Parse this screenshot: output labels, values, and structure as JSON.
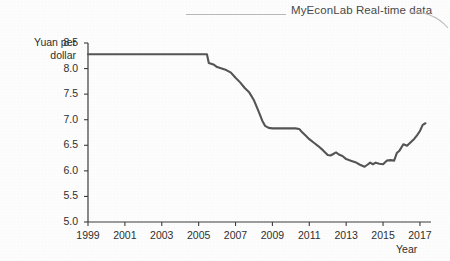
{
  "header": {
    "brand": "MyEconLab",
    "subtitle": "Real-time data",
    "full_title": "MyEconLab Real-time data",
    "rule_icon": "horizontal-rule",
    "curve_icon": "banner-curve"
  },
  "colors": {
    "line": "#555555",
    "axis": "#3d3d3d",
    "text": "#2f2f2f",
    "header_text": "#4a4a4a",
    "rule": "#b9b9b9",
    "background": "#fdfdfd"
  },
  "chart_data": {
    "type": "line",
    "title": "",
    "subtitle": "",
    "xlabel": "Year",
    "ylabel": "Yuan per dollar",
    "ylabel_lines": [
      "Yuan per",
      "dollar"
    ],
    "xlim": [
      1999,
      2017.6
    ],
    "ylim": [
      5.0,
      8.5
    ],
    "grid": false,
    "legend": null,
    "yticks": [
      "8.5",
      "8.0",
      "7.5",
      "7.0",
      "6.5",
      "6.0",
      "5.5",
      "5.0"
    ],
    "ytick_values": [
      8.5,
      8.0,
      7.5,
      7.0,
      6.5,
      6.0,
      5.5,
      5.0
    ],
    "xticks": [
      "1999",
      "2001",
      "2003",
      "2005",
      "2007",
      "2009",
      "2011",
      "2013",
      "2015",
      "2017"
    ],
    "xtick_values": [
      1999,
      2001,
      2003,
      2005,
      2007,
      2009,
      2011,
      2013,
      2015,
      2017
    ],
    "series": [
      {
        "name": "Yuan per dollar exchange rate",
        "x": [
          1999.0,
          1999.5,
          2000.0,
          2000.5,
          2001.0,
          2001.5,
          2002.0,
          2002.5,
          2003.0,
          2003.5,
          2004.0,
          2004.5,
          2005.0,
          2005.45,
          2005.55,
          2005.8,
          2006.0,
          2006.25,
          2006.5,
          2006.75,
          2007.0,
          2007.25,
          2007.5,
          2007.75,
          2008.0,
          2008.15,
          2008.3,
          2008.45,
          2008.6,
          2008.8,
          2009.0,
          2009.25,
          2009.5,
          2009.75,
          2010.0,
          2010.25,
          2010.45,
          2010.6,
          2010.8,
          2011.0,
          2011.25,
          2011.5,
          2011.75,
          2012.0,
          2012.15,
          2012.3,
          2012.45,
          2012.6,
          2012.8,
          2013.0,
          2013.25,
          2013.5,
          2013.75,
          2014.0,
          2014.15,
          2014.3,
          2014.45,
          2014.6,
          2014.8,
          2015.0,
          2015.2,
          2015.4,
          2015.6,
          2015.75,
          2015.9,
          2016.1,
          2016.3,
          2016.5,
          2016.7,
          2016.85,
          2017.0,
          2017.15,
          2017.3
        ],
        "y": [
          8.28,
          8.28,
          8.28,
          8.28,
          8.28,
          8.28,
          8.28,
          8.28,
          8.28,
          8.28,
          8.28,
          8.28,
          8.28,
          8.28,
          8.11,
          8.08,
          8.03,
          8.0,
          7.97,
          7.92,
          7.82,
          7.73,
          7.62,
          7.53,
          7.38,
          7.25,
          7.12,
          6.98,
          6.88,
          6.84,
          6.83,
          6.83,
          6.83,
          6.83,
          6.83,
          6.83,
          6.82,
          6.76,
          6.69,
          6.62,
          6.55,
          6.48,
          6.4,
          6.31,
          6.3,
          6.33,
          6.36,
          6.32,
          6.29,
          6.23,
          6.2,
          6.17,
          6.12,
          6.08,
          6.12,
          6.16,
          6.13,
          6.16,
          6.14,
          6.13,
          6.2,
          6.21,
          6.2,
          6.35,
          6.4,
          6.52,
          6.49,
          6.56,
          6.63,
          6.7,
          6.78,
          6.9,
          6.93
        ]
      }
    ],
    "annotations": [],
    "notes": {
      "peg_value": "8.28",
      "peg_end": "2005",
      "minimum_value": "6.05",
      "minimum_year": "2014",
      "final_value": "6.93"
    }
  }
}
